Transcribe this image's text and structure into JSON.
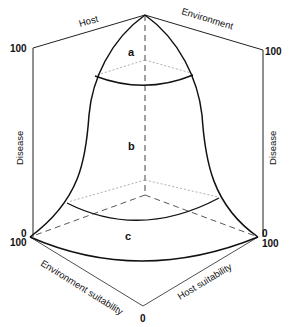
{
  "diagram": {
    "type": "disease-triangle-3d-bell",
    "axes": {
      "top_left": "Host",
      "top_right": "Environment",
      "left_vertical": "Disease",
      "right_vertical": "Disease",
      "bottom_left": "Environment suitability",
      "bottom_right": "Host suitability"
    },
    "ticks": {
      "left_top": "100",
      "right_top": "100",
      "left_bottom_upper": "0",
      "left_bottom_lower": "100",
      "right_bottom_upper": "0",
      "right_bottom_lower": "100",
      "bottom": "0"
    },
    "regions": {
      "a": "a",
      "b": "b",
      "c": "c"
    },
    "colors": {
      "line": "#111111",
      "dotted": "#999999",
      "background": "#ffffff"
    }
  }
}
